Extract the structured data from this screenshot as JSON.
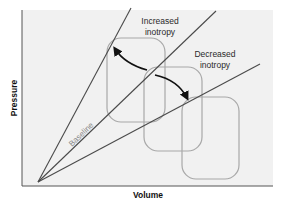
{
  "diagram": {
    "type": "pressure-volume relationship diagram",
    "axes": {
      "x_label": "Volume",
      "y_label": "Pressure"
    },
    "lines": [
      {
        "name": "increased-inotropy-espvr",
        "label": "Increased inotropy"
      },
      {
        "name": "baseline-espvr",
        "label": "Baseline"
      },
      {
        "name": "decreased-inotropy-espvr",
        "label": "Decreased inotropy"
      }
    ],
    "labels": {
      "increased_line1": "Increased",
      "increased_line2": "inotropy",
      "decreased_line1": "Decreased",
      "decreased_line2": "inotropy",
      "baseline": "Baseline"
    },
    "loops": [
      {
        "name": "increased-inotropy-loop"
      },
      {
        "name": "baseline-loop"
      },
      {
        "name": "decreased-inotropy-loop"
      }
    ],
    "arrows": [
      {
        "name": "arrow-to-increased",
        "direction": "up-left"
      },
      {
        "name": "arrow-to-decreased",
        "direction": "down-right"
      }
    ],
    "colors": {
      "plot_background": "#f1f1f1",
      "axis": "#555555",
      "line": "#4a4a4a",
      "loop": "#a8a8a8",
      "arrow": "#111111",
      "baseline_text": "#8a8a8a"
    }
  }
}
